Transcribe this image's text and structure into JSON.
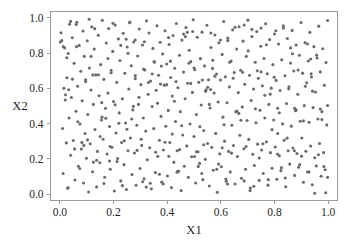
{
  "chart_data": {
    "type": "scatter",
    "title": "",
    "xlabel": "X1",
    "ylabel": "X2",
    "xlim": [
      -0.035,
      1.035
    ],
    "ylim": [
      -0.035,
      1.035
    ],
    "grid": false,
    "legend": null,
    "marker": {
      "shape": "circle",
      "color": "#6b6b6b",
      "size_px": 3.1
    },
    "xticks": [
      "0.0",
      "0.2",
      "0.4",
      "0.6",
      "0.8",
      "1.0"
    ],
    "xtick_values": [
      0.0,
      0.2,
      0.4,
      0.6,
      0.8,
      1.0
    ],
    "yticks": [
      "0.0",
      "0.2",
      "0.4",
      "0.6",
      "0.8",
      "1.0"
    ],
    "ytick_values": [
      0.0,
      0.2,
      0.4,
      0.6,
      0.8,
      1.0
    ],
    "n_points": 500,
    "series": [
      {
        "name": "points",
        "color": "#6b6b6b",
        "x": [
          0.004,
          0.01,
          0.012,
          0.015,
          0.018,
          0.021,
          0.024,
          0.026,
          0.029,
          0.031,
          0.034,
          0.036,
          0.04,
          0.043,
          0.046,
          0.05,
          0.053,
          0.056,
          0.06,
          0.063,
          0.066,
          0.069,
          0.072,
          0.075,
          0.078,
          0.08,
          0.083,
          0.086,
          0.088,
          0.091,
          0.094,
          0.096,
          0.099,
          0.102,
          0.104,
          0.107,
          0.11,
          0.113,
          0.116,
          0.119,
          0.122,
          0.125,
          0.128,
          0.131,
          0.134,
          0.137,
          0.14,
          0.143,
          0.146,
          0.149,
          0.152,
          0.155,
          0.158,
          0.161,
          0.164,
          0.167,
          0.17,
          0.173,
          0.176,
          0.179,
          0.182,
          0.185,
          0.188,
          0.191,
          0.194,
          0.197,
          0.2,
          0.203,
          0.206,
          0.209,
          0.212,
          0.215,
          0.218,
          0.221,
          0.224,
          0.227,
          0.23,
          0.233,
          0.236,
          0.239,
          0.242,
          0.245,
          0.248,
          0.251,
          0.254,
          0.257,
          0.26,
          0.263,
          0.266,
          0.269,
          0.272,
          0.275,
          0.278,
          0.281,
          0.284,
          0.287,
          0.29,
          0.293,
          0.296,
          0.299,
          0.302,
          0.305,
          0.308,
          0.311,
          0.314,
          0.317,
          0.32,
          0.323,
          0.326,
          0.329,
          0.332,
          0.335,
          0.338,
          0.341,
          0.344,
          0.347,
          0.35,
          0.353,
          0.356,
          0.359,
          0.362,
          0.365,
          0.368,
          0.371,
          0.374,
          0.377,
          0.38,
          0.383,
          0.386,
          0.389,
          0.392,
          0.395,
          0.398,
          0.401,
          0.404,
          0.407,
          0.41,
          0.413,
          0.416,
          0.419,
          0.422,
          0.425,
          0.428,
          0.431,
          0.434,
          0.437,
          0.44,
          0.443,
          0.446,
          0.449,
          0.452,
          0.455,
          0.458,
          0.461,
          0.464,
          0.467,
          0.47,
          0.473,
          0.476,
          0.479,
          0.482,
          0.485,
          0.488,
          0.491,
          0.494,
          0.497,
          0.5,
          0.503,
          0.506,
          0.509,
          0.512,
          0.515,
          0.518,
          0.521,
          0.524,
          0.527,
          0.53,
          0.533,
          0.536,
          0.539,
          0.542,
          0.545,
          0.548,
          0.551,
          0.554,
          0.557,
          0.56,
          0.563,
          0.566,
          0.569,
          0.572,
          0.575,
          0.578,
          0.581,
          0.584,
          0.587,
          0.59,
          0.593,
          0.596,
          0.599,
          0.602,
          0.605,
          0.608,
          0.611,
          0.614,
          0.617,
          0.62,
          0.623,
          0.626,
          0.629,
          0.632,
          0.635,
          0.638,
          0.641,
          0.644,
          0.647,
          0.65,
          0.653,
          0.656,
          0.659,
          0.662,
          0.665,
          0.668,
          0.671,
          0.674,
          0.677,
          0.68,
          0.683,
          0.686,
          0.689,
          0.692,
          0.695,
          0.698,
          0.701,
          0.704,
          0.707,
          0.71,
          0.713,
          0.716,
          0.719,
          0.722,
          0.725,
          0.728,
          0.731,
          0.734,
          0.737,
          0.74,
          0.743,
          0.746,
          0.749,
          0.752,
          0.755,
          0.758,
          0.761,
          0.764,
          0.767,
          0.77,
          0.773,
          0.776,
          0.779,
          0.782,
          0.785,
          0.788,
          0.791,
          0.794,
          0.797,
          0.8,
          0.803,
          0.806,
          0.809,
          0.812,
          0.815,
          0.818,
          0.821,
          0.824,
          0.827,
          0.83,
          0.833,
          0.836,
          0.839,
          0.842,
          0.845,
          0.848,
          0.851,
          0.854,
          0.857,
          0.86,
          0.863,
          0.866,
          0.869,
          0.872,
          0.875,
          0.878,
          0.881,
          0.884,
          0.887,
          0.89,
          0.893,
          0.896,
          0.899,
          0.902,
          0.905,
          0.908,
          0.911,
          0.914,
          0.917,
          0.92,
          0.923,
          0.926,
          0.929,
          0.932,
          0.935,
          0.938,
          0.941,
          0.944,
          0.947,
          0.95,
          0.953,
          0.956,
          0.959,
          0.962,
          0.965,
          0.968,
          0.971,
          0.974,
          0.977,
          0.98,
          0.983,
          0.986,
          0.989,
          0.992,
          0.995,
          0.998,
          0.007,
          0.047,
          0.089,
          0.13,
          0.171,
          0.213,
          0.254,
          0.295,
          0.337,
          0.378,
          0.419,
          0.461,
          0.502,
          0.543,
          0.585,
          0.626,
          0.667,
          0.709,
          0.75,
          0.791,
          0.833,
          0.874,
          0.915,
          0.957,
          0.998,
          0.02,
          0.061,
          0.103,
          0.144,
          0.185,
          0.227,
          0.268,
          0.309,
          0.351,
          0.392,
          0.433,
          0.475,
          0.516,
          0.557,
          0.599,
          0.64,
          0.681,
          0.723,
          0.764,
          0.805,
          0.847,
          0.888,
          0.929,
          0.971,
          0.013,
          0.055,
          0.096,
          0.137,
          0.179,
          0.22,
          0.261,
          0.303,
          0.344,
          0.385,
          0.427,
          0.468,
          0.509,
          0.551,
          0.592,
          0.633,
          0.675,
          0.716,
          0.757,
          0.799,
          0.84,
          0.881,
          0.923,
          0.964,
          0.033,
          0.074,
          0.116,
          0.157,
          0.198,
          0.24,
          0.281,
          0.322,
          0.364,
          0.405,
          0.446,
          0.488,
          0.529,
          0.57,
          0.612,
          0.653,
          0.694,
          0.736,
          0.777,
          0.818,
          0.86,
          0.901,
          0.942,
          0.984,
          0.026,
          0.067,
          0.109,
          0.15,
          0.191,
          0.233,
          0.274,
          0.315,
          0.357,
          0.398,
          0.439,
          0.481,
          0.522,
          0.563,
          0.605,
          0.646,
          0.687,
          0.729,
          0.77,
          0.811,
          0.853,
          0.894,
          0.935,
          0.977,
          0.04,
          0.082,
          0.123,
          0.164,
          0.206,
          0.247,
          0.288,
          0.33,
          0.371,
          0.412,
          0.454,
          0.495,
          0.536,
          0.578,
          0.619,
          0.66,
          0.702,
          0.743,
          0.784,
          0.826,
          0.867,
          0.908,
          0.95,
          0.991,
          0.002,
          0.998,
          0.5,
          0.25,
          0.75,
          0.125,
          0.375,
          0.625,
          0.875,
          0.062,
          0.187,
          0.312,
          0.437,
          0.562,
          0.687,
          0.812,
          0.937,
          0.031,
          0.156,
          0.281,
          0.406,
          0.531
        ],
        "y": [
          0.915,
          0.373,
          0.118,
          0.6,
          0.828,
          0.564,
          0.291,
          0.66,
          0.035,
          0.797,
          0.432,
          0.963,
          0.221,
          0.548,
          0.886,
          0.305,
          0.742,
          0.081,
          0.47,
          0.974,
          0.612,
          0.159,
          0.843,
          0.398,
          0.697,
          0.256,
          0.53,
          0.925,
          0.064,
          0.781,
          0.344,
          0.638,
          0.204,
          0.869,
          0.452,
          0.013,
          0.715,
          0.286,
          0.591,
          0.948,
          0.128,
          0.509,
          0.822,
          0.367,
          0.676,
          0.042,
          0.243,
          0.9,
          0.558,
          0.179,
          0.734,
          0.421,
          0.985,
          0.312,
          0.651,
          0.097,
          0.487,
          0.856,
          0.228,
          0.573,
          0.939,
          0.384,
          0.142,
          0.702,
          0.266,
          0.809,
          0.525,
          0.019,
          0.958,
          0.347,
          0.634,
          0.203,
          0.88,
          0.461,
          0.758,
          0.076,
          0.293,
          0.541,
          0.912,
          0.168,
          0.685,
          0.404,
          0.027,
          0.834,
          0.247,
          0.596,
          0.971,
          0.319,
          0.728,
          0.112,
          0.478,
          0.862,
          0.234,
          0.655,
          0.051,
          0.391,
          0.783,
          0.509,
          0.936,
          0.146,
          0.621,
          0.277,
          0.845,
          0.432,
          0.088,
          0.704,
          0.358,
          0.982,
          0.196,
          0.566,
          0.913,
          0.264,
          0.641,
          0.031,
          0.497,
          0.826,
          0.372,
          0.748,
          0.123,
          0.589,
          0.954,
          0.215,
          0.674,
          0.306,
          0.861,
          0.441,
          0.069,
          0.795,
          0.251,
          0.618,
          0.926,
          0.385,
          0.738,
          0.104,
          0.475,
          0.848,
          0.293,
          0.661,
          0.038,
          0.556,
          0.899,
          0.182,
          0.714,
          0.412,
          0.967,
          0.247,
          0.603,
          0.131,
          0.787,
          0.468,
          0.022,
          0.873,
          0.336,
          0.692,
          0.159,
          0.541,
          0.944,
          0.274,
          0.629,
          0.096,
          0.816,
          0.398,
          0.751,
          0.213,
          0.577,
          0.988,
          0.327,
          0.705,
          0.064,
          0.452,
          0.889,
          0.241,
          0.634,
          0.175,
          0.768,
          0.506,
          0.918,
          0.083,
          0.361,
          0.727,
          0.198,
          0.592,
          0.957,
          0.288,
          0.648,
          0.047,
          0.489,
          0.831,
          0.266,
          0.713,
          0.136,
          0.574,
          0.902,
          0.345,
          0.681,
          0.011,
          0.523,
          0.858,
          0.229,
          0.647,
          0.156,
          0.792,
          0.437,
          0.978,
          0.301,
          0.665,
          0.074,
          0.518,
          0.884,
          0.243,
          0.608,
          0.127,
          0.754,
          0.391,
          0.931,
          0.276,
          0.689,
          0.058,
          0.467,
          0.822,
          0.214,
          0.576,
          0.949,
          0.334,
          0.702,
          0.091,
          0.495,
          0.867,
          0.258,
          0.623,
          0.142,
          0.781,
          0.418,
          0.986,
          0.311,
          0.674,
          0.036,
          0.531,
          0.893,
          0.227,
          0.596,
          0.163,
          0.748,
          0.405,
          0.922,
          0.284,
          0.657,
          0.079,
          0.476,
          0.838,
          0.251,
          0.614,
          0.118,
          0.769,
          0.432,
          0.965,
          0.297,
          0.683,
          0.052,
          0.509,
          0.876,
          0.236,
          0.601,
          0.148,
          0.734,
          0.421,
          0.908,
          0.268,
          0.645,
          0.085,
          0.487,
          0.851,
          0.219,
          0.588,
          0.134,
          0.762,
          0.399,
          0.941,
          0.306,
          0.671,
          0.043,
          0.514,
          0.882,
          0.247,
          0.609,
          0.171,
          0.743,
          0.386,
          0.928,
          0.262,
          0.698,
          0.107,
          0.473,
          0.845,
          0.231,
          0.566,
          0.153,
          0.787,
          0.414,
          0.973,
          0.319,
          0.686,
          0.068,
          0.502,
          0.859,
          0.244,
          0.631,
          0.126,
          0.755,
          0.408,
          0.917,
          0.273,
          0.664,
          0.054,
          0.491,
          0.836,
          0.207,
          0.579,
          0.161,
          0.772,
          0.426,
          0.952,
          0.288,
          0.693,
          0.102,
          0.468,
          0.824,
          0.236,
          0.617,
          0.139,
          0.746,
          0.393,
          0.984,
          0.871,
          0.652,
          0.277,
          0.938,
          0.431,
          0.186,
          0.798,
          0.549,
          0.063,
          0.726,
          0.341,
          0.907,
          0.214,
          0.583,
          0.142,
          0.869,
          0.458,
          0.021,
          0.693,
          0.366,
          0.954,
          0.247,
          0.612,
          0.788,
          0.096,
          0.534,
          0.961,
          0.308,
          0.677,
          0.189,
          0.843,
          0.426,
          0.071,
          0.752,
          0.295,
          0.638,
          0.917,
          0.158,
          0.509,
          0.874,
          0.233,
          0.691,
          0.046,
          0.561,
          0.926,
          0.318,
          0.704,
          0.127,
          0.483,
          0.836,
          0.257,
          0.648,
          0.193,
          0.769,
          0.402,
          0.975,
          0.312,
          0.681,
          0.058,
          0.527,
          0.893,
          0.241,
          0.606,
          0.171,
          0.748,
          0.419,
          0.934,
          0.286,
          0.663,
          0.092,
          0.478,
          0.851,
          0.224,
          0.592,
          0.146,
          0.781,
          0.437,
          0.968,
          0.303,
          0.672,
          0.041,
          0.516,
          0.887,
          0.253,
          0.628,
          0.118,
          0.759,
          0.394,
          0.946,
          0.271,
          0.699,
          0.083,
          0.462,
          0.829,
          0.216,
          0.584,
          0.157,
          0.773,
          0.411,
          0.991,
          0.327,
          0.688,
          0.049,
          0.498,
          0.864,
          0.238,
          0.621,
          0.131,
          0.742,
          0.383,
          0.913,
          0.264,
          0.657,
          0.076,
          0.484,
          0.847,
          0.228,
          0.597,
          0.168,
          0.766,
          0.423,
          0.979,
          0.294,
          0.676,
          0.061,
          0.507,
          0.878,
          0.249,
          0.633,
          0.114,
          0.754,
          0.388,
          0.922,
          0.281,
          0.669,
          0.087,
          0.471,
          0.812,
          0.206,
          0.567,
          0.151,
          0.796,
          0.416,
          0.006,
          0.009,
          0.862,
          0.503,
          0.715,
          0.368,
          0.941,
          0.182,
          0.624,
          0.058,
          0.487,
          0.836,
          0.271,
          0.709,
          0.125,
          0.593,
          0.958,
          0.344,
          0.682,
          0.037,
          0.519,
          0.874,
          0.215,
          0.647
        ]
      }
    ]
  },
  "axes": {
    "x_title": "X1",
    "y_title": "X2"
  }
}
